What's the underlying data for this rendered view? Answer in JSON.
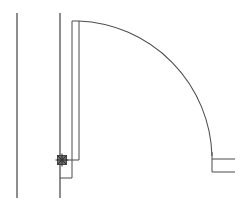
{
  "drawing": {
    "title": "Door Swing Plan Detail",
    "type": "cad-line-drawing",
    "subject": "single-leaf door, 90 degree swing arc, plan view",
    "background_color": "#ffffff",
    "line_color": "#3a3a3a",
    "arc_color": "#4c4c4c",
    "hinge_color": "#2e2e2e",
    "canvas": {
      "width": 246,
      "height": 205
    },
    "elements": {
      "wall_line_outer": {
        "name": "wall-line-outer",
        "kind": "vertical-line",
        "x": 17,
        "y1": 13,
        "y2": 198
      },
      "wall_line_inner": {
        "name": "wall-line-inner",
        "kind": "vertical-line",
        "x": 60,
        "y1": 13,
        "y2": 198
      },
      "door_leaf_left": {
        "name": "door-leaf-edge-left",
        "kind": "vertical-line",
        "x": 72,
        "y1": 21,
        "y2": 160
      },
      "door_leaf_right": {
        "name": "door-leaf-edge-right",
        "kind": "vertical-line",
        "x": 79,
        "y1": 21,
        "y2": 160
      },
      "door_leaf_top": {
        "name": "door-leaf-top-cap",
        "kind": "horizontal-line",
        "y": 21,
        "x1": 72,
        "x2": 79
      },
      "door_leaf_bottom": {
        "name": "door-leaf-bottom-cap",
        "kind": "horizontal-line",
        "y": 160,
        "x1": 62,
        "x2": 79
      },
      "swing_arc": {
        "name": "door-swing-arc",
        "kind": "quarter-arc",
        "center_x": 79,
        "center_y": 160,
        "radius": 139,
        "start_angle_deg": 90,
        "end_angle_deg": 0,
        "sweep": "clockwise",
        "start_point": [
          79,
          21
        ],
        "end_point": [
          212,
          156
        ]
      },
      "arc_end_vertical": {
        "name": "strike-jamb-line",
        "kind": "vertical-line",
        "x": 212,
        "y1": 152,
        "y2": 172
      },
      "jamb_rail_upper": {
        "name": "jamb-rail-upper",
        "kind": "horizontal-line",
        "y": 159,
        "x1": 212,
        "x2": 235
      },
      "jamb_rail_lower": {
        "name": "jamb-rail-lower",
        "kind": "horizontal-line",
        "y": 172,
        "x1": 212,
        "x2": 235
      },
      "threshold_line": {
        "name": "threshold-line",
        "kind": "horizontal-line",
        "y": 178,
        "x1": 60,
        "x2": 72
      },
      "threshold_return": {
        "name": "threshold-return-line",
        "kind": "vertical-line",
        "x": 72,
        "y1": 160,
        "y2": 178
      },
      "hinge_marker": {
        "name": "hinge-pivot-marker",
        "kind": "cross-in-square-node",
        "x": 62,
        "y": 160,
        "size": 9
      }
    }
  }
}
